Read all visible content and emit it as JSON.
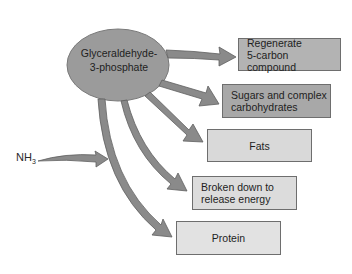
{
  "diagram": {
    "source_node": {
      "label_line1": "Glyceraldehyde-",
      "label_line2": "3-phosphate",
      "fill": "#9b9b9b"
    },
    "input": {
      "label": "NH",
      "subscript": "3"
    },
    "targets": [
      {
        "line1": "Regenerate",
        "line2": "5-carbon compound",
        "fill": "#b3b3b3"
      },
      {
        "line1": "Sugars and complex",
        "line2": "carbohydrates",
        "fill": "#a8a8a8"
      },
      {
        "line1": "Fats",
        "line2": "",
        "fill": "#d9d9d9"
      },
      {
        "line1": "Broken down to",
        "line2": "release energy",
        "fill": "#dcdcdc"
      },
      {
        "line1": "Protein",
        "line2": "",
        "fill": "#e2e2e2"
      }
    ],
    "arrow_color": "#8a8a8a",
    "arrow_stroke": "#5f5f5f"
  }
}
